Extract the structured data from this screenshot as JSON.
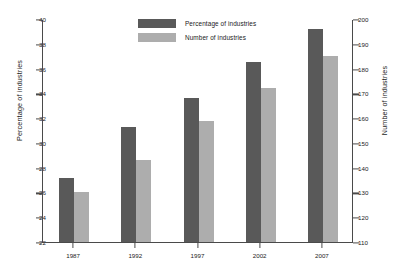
{
  "chart_data": {
    "type": "bar",
    "title": "",
    "xlabel": "",
    "ylabel": "Percentage of industries",
    "y2label": "Number of industries",
    "categories": [
      "1987",
      "1992",
      "1997",
      "2002",
      "2007"
    ],
    "series": [
      {
        "name": "Percentage of industries",
        "axis": "left",
        "color": "#595959",
        "values": [
          27.2,
          31.3,
          33.6,
          36.5,
          39.2
        ]
      },
      {
        "name": "Number of industries",
        "axis": "right",
        "color": "#adadad",
        "values": [
          130,
          143,
          159,
          172,
          185
        ]
      }
    ],
    "ylim": [
      22,
      40
    ],
    "yticks": [
      "22",
      "24",
      "26",
      "28",
      "30",
      "32",
      "34",
      "36",
      "38",
      "40"
    ],
    "y2lim": [
      110,
      200
    ],
    "y2ticks": [
      "110",
      "120",
      "130",
      "140",
      "150",
      "160",
      "170",
      "180",
      "190",
      "200"
    ],
    "grid": false,
    "legend_position": "top-center",
    "legend": [
      "Percentage of industries",
      "Number of industries"
    ]
  },
  "colors": {
    "series_dark": "#595959",
    "series_light": "#adadad",
    "axis": "#4a4a4a",
    "background": "#ffffff"
  }
}
